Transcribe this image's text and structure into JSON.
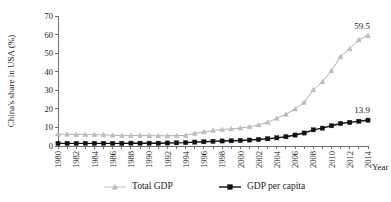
{
  "chart_data": {
    "type": "line",
    "title": "",
    "xlabel": "Year",
    "ylabel": "China's share in USA (%)",
    "ylim": [
      0,
      70
    ],
    "yticks": [
      0,
      10,
      20,
      30,
      40,
      50,
      60,
      70
    ],
    "xlim": [
      1980,
      2014
    ],
    "grid": false,
    "legend_position": "bottom",
    "x": [
      1980,
      1981,
      1982,
      1983,
      1984,
      1985,
      1986,
      1987,
      1988,
      1989,
      1990,
      1991,
      1992,
      1993,
      1994,
      1995,
      1996,
      1997,
      1998,
      1999,
      2000,
      2001,
      2002,
      2003,
      2004,
      2005,
      2006,
      2007,
      2008,
      2009,
      2010,
      2011,
      2012,
      2013,
      2014
    ],
    "xtick_labels": [
      "1980",
      "1982",
      "1984",
      "1986",
      "1988",
      "1990",
      "1992",
      "1994",
      "1996",
      "1998",
      "2000",
      "2002",
      "2004",
      "2006",
      "2008",
      "2010",
      "2012",
      "2014"
    ],
    "series": [
      {
        "name": "Total GDP",
        "marker": "triangle",
        "color": "#bfbfbf",
        "values": [
          6.5,
          6.3,
          6.2,
          6.2,
          6.1,
          6.0,
          5.8,
          5.6,
          5.6,
          5.7,
          5.6,
          5.5,
          5.5,
          5.6,
          5.7,
          6.8,
          7.6,
          8.4,
          8.9,
          9.2,
          9.7,
          10.4,
          11.4,
          12.8,
          14.9,
          17.1,
          19.9,
          23.5,
          30.3,
          34.6,
          40.6,
          48.2,
          52.4,
          57.2,
          59.5
        ],
        "end_label": "59.5"
      },
      {
        "name": "GDP per capita",
        "marker": "square",
        "color": "#111111",
        "values": [
          1.4,
          1.4,
          1.4,
          1.4,
          1.4,
          1.4,
          1.4,
          1.4,
          1.5,
          1.5,
          1.5,
          1.5,
          1.6,
          1.7,
          1.8,
          2.1,
          2.3,
          2.5,
          2.7,
          2.8,
          3.0,
          3.2,
          3.5,
          3.9,
          4.4,
          5.0,
          5.9,
          7.0,
          8.7,
          9.6,
          10.9,
          12.1,
          12.7,
          13.3,
          13.9
        ],
        "end_label": "13.9"
      }
    ],
    "annotations": [
      {
        "text": "59.5",
        "series": "Total GDP",
        "x": 2014
      },
      {
        "text": "13.9",
        "series": "GDP per capita",
        "x": 2014
      }
    ],
    "legend": [
      {
        "label": "Total GDP",
        "marker": "triangle",
        "color": "#bfbfbf"
      },
      {
        "label": "GDP per capita",
        "marker": "square",
        "color": "#111111"
      }
    ]
  }
}
